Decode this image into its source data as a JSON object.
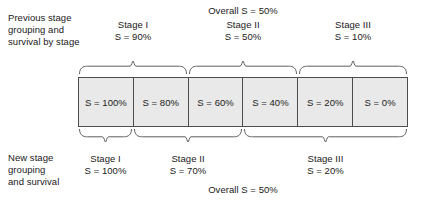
{
  "diagram": {
    "title_top": "Overall S = 50%",
    "title_bottom": "Overall S = 50%",
    "left_label_top": "Previous stage\ngrouping and\nsurvival by stage",
    "left_label_bottom": "New stage\ngrouping\nand survival",
    "cells": [
      {
        "label": "S = 100%"
      },
      {
        "label": "S = 80%"
      },
      {
        "label": "S = 60%"
      },
      {
        "label": "S = 40%"
      },
      {
        "label": "S = 20%"
      },
      {
        "label": "S = 0%"
      }
    ],
    "top_groups": [
      {
        "stage": "Stage I",
        "survival": "S = 90%",
        "span": 2,
        "start": 0
      },
      {
        "stage": "Stage II",
        "survival": "S = 50%",
        "span": 2,
        "start": 2
      },
      {
        "stage": "Stage III",
        "survival": "S = 10%",
        "span": 2,
        "start": 4
      }
    ],
    "bottom_groups": [
      {
        "stage": "Stage I",
        "survival": "S = 100%",
        "span": 1,
        "start": 0
      },
      {
        "stage": "Stage II",
        "survival": "S = 70%",
        "span": 2,
        "start": 1
      },
      {
        "stage": "Stage III",
        "survival": "S = 20%",
        "span": 3,
        "start": 3
      }
    ],
    "colors": {
      "cell_fill": "#e9e9e9",
      "cell_border": "#4d4d4d",
      "brace_stroke": "#4d4d4d",
      "text": "#1a1a1a",
      "background": "#ffffff"
    }
  }
}
